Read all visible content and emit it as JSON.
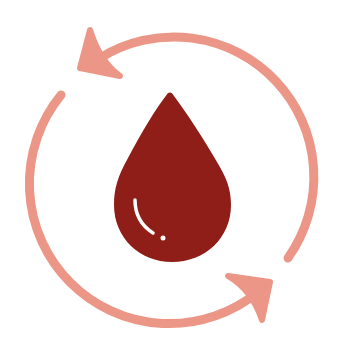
{
  "icon": {
    "name": "blood-cycle-icon",
    "colors": {
      "arrows": "#EB9686",
      "drop": "#8E1E17",
      "highlight": "#FFFFFF",
      "background": "#FFFFFF"
    }
  }
}
